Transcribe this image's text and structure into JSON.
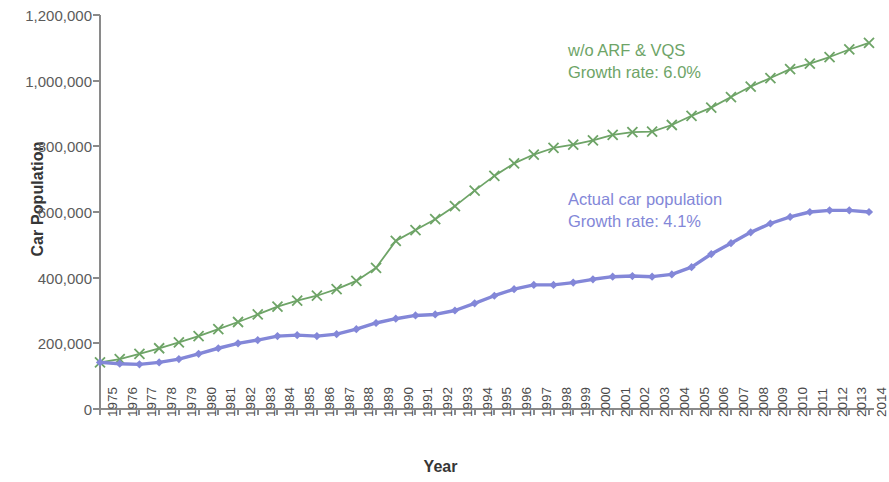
{
  "chart_data": {
    "type": "line",
    "title": "",
    "xlabel": "Year",
    "ylabel": "Car Population",
    "xlim": [
      1975,
      2014
    ],
    "ylim": [
      0,
      1200000
    ],
    "grid": false,
    "legend_position": "inline-annotation",
    "ytick_labels": [
      "0",
      "200,000",
      "400,000",
      "600,000",
      "800,000",
      "1,000,000",
      "1,200,000"
    ],
    "ytick_values": [
      0,
      200000,
      400000,
      600000,
      800000,
      1000000,
      1200000
    ],
    "x": [
      1975,
      1976,
      1977,
      1978,
      1979,
      1980,
      1981,
      1982,
      1983,
      1984,
      1985,
      1986,
      1987,
      1988,
      1989,
      1990,
      1991,
      1992,
      1993,
      1994,
      1995,
      1996,
      1997,
      1998,
      1999,
      2000,
      2001,
      2002,
      2003,
      2004,
      2005,
      2006,
      2007,
      2008,
      2009,
      2010,
      2011,
      2012,
      2013,
      2014
    ],
    "xtick_labels": [
      "1975",
      "1976",
      "1977",
      "1978",
      "1979",
      "1980",
      "1981",
      "1982",
      "1983",
      "1984",
      "1985",
      "1986",
      "1987",
      "1988",
      "1989",
      "1990",
      "1991",
      "1992",
      "1993",
      "1994",
      "1995",
      "1996",
      "1997",
      "1998",
      "1999",
      "2000",
      "2001",
      "2002",
      "2003",
      "2004",
      "2005",
      "2006",
      "2007",
      "2008",
      "2009",
      "2010",
      "2011",
      "2012",
      "2013",
      "2014"
    ],
    "series": [
      {
        "name": "w/o ARF & VQS",
        "color": "#6ea467",
        "marker": "x",
        "growth_rate": "6.0%",
        "annotation_line1": "w/o ARF & VQS",
        "annotation_line2": "Growth rate: 6.0%",
        "values": [
          142000,
          152000,
          168000,
          185000,
          203000,
          222000,
          243000,
          265000,
          288000,
          312000,
          330000,
          345000,
          365000,
          390000,
          430000,
          512000,
          545000,
          578000,
          618000,
          665000,
          710000,
          748000,
          775000,
          795000,
          805000,
          818000,
          835000,
          843000,
          845000,
          865000,
          893000,
          918000,
          950000,
          982000,
          1008000,
          1035000,
          1052000,
          1072000,
          1095000,
          1115000
        ]
      },
      {
        "name": "Actual car population",
        "color": "#8387d8",
        "marker": "diamond",
        "growth_rate": "4.1%",
        "annotation_line1": "Actual car population",
        "annotation_line2": "Growth rate: 4.1%",
        "values": [
          142000,
          138000,
          136000,
          142000,
          152000,
          168000,
          185000,
          200000,
          210000,
          222000,
          225000,
          222000,
          228000,
          243000,
          262000,
          275000,
          285000,
          288000,
          300000,
          322000,
          345000,
          365000,
          378000,
          378000,
          385000,
          395000,
          403000,
          405000,
          403000,
          410000,
          432000,
          472000,
          505000,
          538000,
          565000,
          585000,
          600000,
          605000,
          605000,
          600000
        ]
      }
    ]
  },
  "axes": {
    "y_title": "Car Population",
    "x_title": "Year"
  }
}
